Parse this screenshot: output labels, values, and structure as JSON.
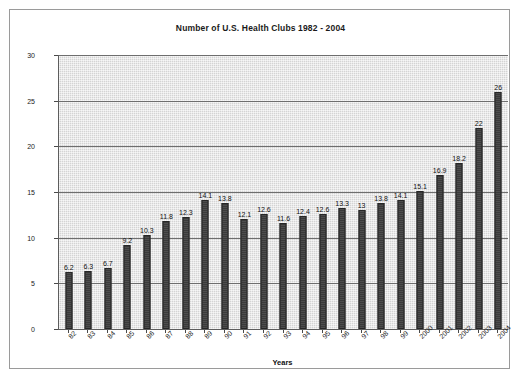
{
  "figure": {
    "title": "Number of U.S. Health Clubs 1982 - 2004",
    "xlabel": "Years",
    "ylabel": "Number of Clubs (thousands)"
  },
  "colors": {
    "bar_fill": "#3a3a3a",
    "bar_edge": "#262626",
    "plot_background": "#d4d4d4",
    "gridline": "#6e6e6e",
    "axis_line": "#5d5d5d",
    "frame_border": "#9a9a9a",
    "text": "#111111"
  },
  "chart_data": {
    "type": "bar",
    "title": "Number of U.S. Health Clubs 1982 - 2004",
    "xlabel": "Years",
    "ylabel": "Number of Clubs (thousands)",
    "categories": [
      "82",
      "83",
      "84",
      "85",
      "86",
      "87",
      "88",
      "89",
      "90",
      "91",
      "92",
      "93",
      "94",
      "95",
      "96",
      "97",
      "98",
      "99",
      "2000",
      "2001",
      "2002",
      "2003",
      "2004"
    ],
    "values": [
      6.2,
      6.3,
      6.7,
      9.2,
      10.3,
      11.8,
      12.3,
      14.1,
      13.8,
      12.1,
      12.6,
      11.6,
      12.4,
      12.6,
      13.3,
      13,
      13.8,
      14.1,
      15.1,
      16.9,
      18.2,
      22,
      26
    ],
    "value_labels": [
      "6.2",
      "6.3",
      "6.7",
      "9.2",
      "10.3",
      "11.8",
      "12.3",
      "14.1",
      "13.8",
      "12.1",
      "12.6",
      "11.6",
      "12.4",
      "12.6",
      "13.3",
      "13",
      "13.8",
      "14.1",
      "15.1",
      "16.9",
      "18.2",
      "22",
      "26"
    ],
    "ylim": [
      0,
      30
    ],
    "yticks": [
      0,
      5,
      10,
      15,
      20,
      25,
      30
    ],
    "ytick_labels": [
      "0",
      "5",
      "10",
      "15",
      "20",
      "25",
      "30"
    ],
    "grid": true,
    "grid_axis": "y",
    "legend": false,
    "legend_position": "none",
    "series": [
      {
        "name": "Number of Clubs (thousands)",
        "values": [
          6.2,
          6.3,
          6.7,
          9.2,
          10.3,
          11.8,
          12.3,
          14.1,
          13.8,
          12.1,
          12.6,
          11.6,
          12.4,
          12.6,
          13.3,
          13,
          13.8,
          14.1,
          15.1,
          16.9,
          18.2,
          22,
          26
        ]
      }
    ]
  }
}
